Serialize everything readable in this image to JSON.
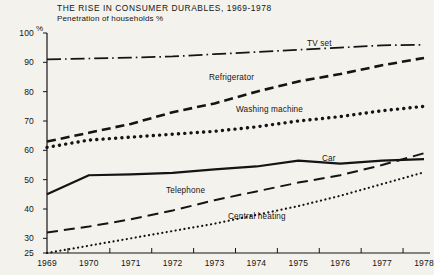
{
  "chart_data": {
    "type": "line",
    "title": "THE RISE IN CONSUMER DURABLES, 1969-1978",
    "subtitle": "Penetration of households %",
    "xlabel": "",
    "ylabel": "%",
    "ylim": [
      25,
      100
    ],
    "xlim": [
      1969,
      1978
    ],
    "grid": false,
    "legend_position": "inline-annotations",
    "ytick_labels": [
      "100",
      "90",
      "80",
      "70",
      "60",
      "50",
      "40",
      "30",
      "25"
    ],
    "yticks": [
      100,
      90,
      80,
      70,
      60,
      50,
      40,
      30,
      25
    ],
    "categories": [
      1969,
      1970,
      1971,
      1972,
      1973,
      1974,
      1975,
      1976,
      1977,
      1978
    ],
    "xtick_labels": [
      "1969",
      "1970",
      "1971",
      "1972",
      "1973",
      "1974",
      "1975",
      "1976",
      "1977",
      "1978"
    ],
    "series": [
      {
        "name": "TV set",
        "style": "dash-dot",
        "values": [
          91,
          91.3,
          91.6,
          92,
          92.8,
          93.5,
          94.3,
          95,
          95.8,
          96
        ]
      },
      {
        "name": "Refrigerator",
        "style": "dashed",
        "values": [
          63,
          66,
          69,
          73,
          76,
          80,
          83.5,
          86,
          89,
          91.5
        ]
      },
      {
        "name": "Washing machine",
        "style": "dotted",
        "values": [
          61,
          63.5,
          64.5,
          65.5,
          66.5,
          68,
          70,
          71.5,
          73.5,
          75
        ]
      },
      {
        "name": "Car",
        "style": "solid",
        "values": [
          45,
          51.5,
          51.8,
          52.3,
          53.5,
          54.5,
          56.5,
          55.5,
          56.5,
          57
        ]
      },
      {
        "name": "Telephone",
        "style": "long-dash",
        "values": [
          32,
          34,
          36.5,
          39.5,
          43,
          46,
          49,
          51.5,
          55,
          59
        ]
      },
      {
        "name": "Central heating",
        "style": "fine-dotted",
        "values": [
          25,
          27.5,
          30,
          32.5,
          35,
          38,
          41,
          44.5,
          48.5,
          52.5
        ]
      }
    ]
  },
  "colors": {
    "background": "#f4f2ed",
    "ink": "#141414",
    "axis": "#141414"
  }
}
